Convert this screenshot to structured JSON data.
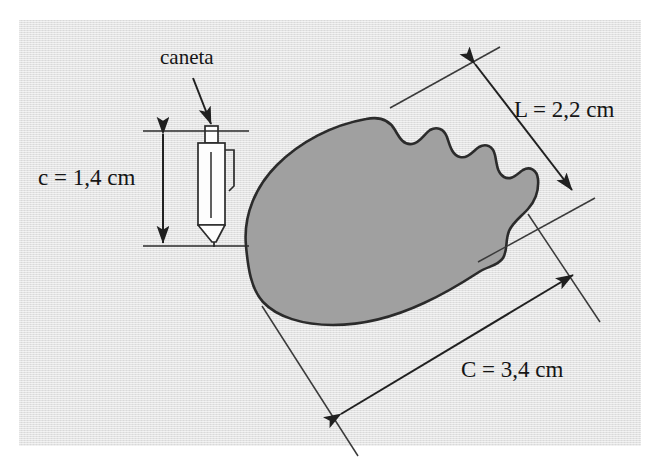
{
  "figure": {
    "title": "caneta",
    "background_color": "#e3e3e3",
    "page_color": "#ffffff",
    "ink_color": "#151515",
    "line_color": "#3a3a3a",
    "shape_fill_color": "#a0a0a0",
    "shape_stroke_color": "#2b2b2b"
  },
  "labels": {
    "pen_callout": "caneta",
    "pen_length": "c = 1,4 cm",
    "object_width": "L = 2,2 cm",
    "object_length": "C = 3,4 cm"
  },
  "measurements": [
    {
      "symbol": "c",
      "value": "1,4",
      "unit": "cm",
      "text": "c = 1,4 cm",
      "refers_to": "caneta",
      "orientation": "vertical"
    },
    {
      "symbol": "L",
      "value": "2,2",
      "unit": "cm",
      "text": "L = 2,2 cm",
      "refers_to": "object-width",
      "orientation": "diagonal"
    },
    {
      "symbol": "C",
      "value": "3,4",
      "unit": "cm",
      "text": "C = 3,4 cm",
      "refers_to": "object-length",
      "orientation": "diagonal"
    }
  ],
  "icons": {
    "pen": "pen-icon",
    "callout_arrow": "arrow-down-icon",
    "dimension_arrow_vertical": "double-arrow-vertical-icon",
    "dimension_arrow_width": "double-arrow-diagonal-icon",
    "dimension_arrow_length": "double-arrow-diagonal-icon",
    "specimen": "seed-shape-icon"
  }
}
